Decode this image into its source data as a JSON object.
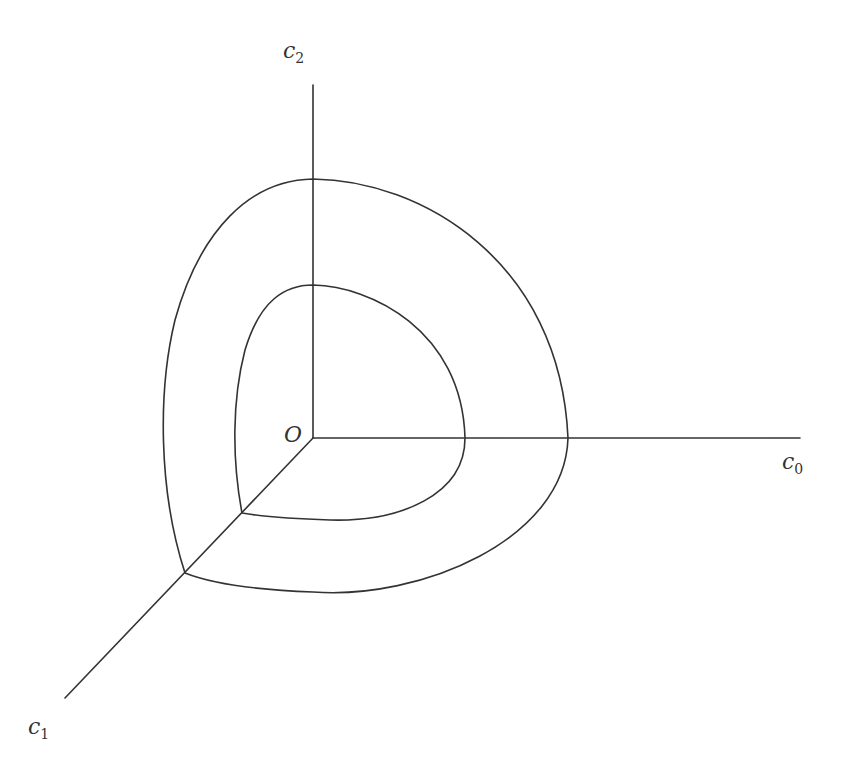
{
  "diagram": {
    "title": "",
    "stroke_color": "#333333",
    "background": "#ffffff",
    "origin": {
      "label": "O",
      "x": 313,
      "y": 438
    },
    "axes": [
      {
        "name": "c0",
        "symbol": "c",
        "subscript": "0",
        "from": [
          313,
          438
        ],
        "to": [
          800,
          438
        ],
        "label_pos": [
          782,
          451
        ]
      },
      {
        "name": "c1",
        "symbol": "c",
        "subscript": "1",
        "from": [
          313,
          438
        ],
        "to": [
          65,
          698
        ],
        "label_pos": [
          28,
          718
        ]
      },
      {
        "name": "c2",
        "symbol": "c",
        "subscript": "2",
        "from": [
          313,
          438
        ],
        "to": [
          313,
          85
        ],
        "label_pos": [
          283,
          42
        ]
      }
    ],
    "curves": [
      {
        "name": "outer-level-surface",
        "intersections": {
          "c2": [
            313,
            179
          ],
          "c0": [
            568,
            438
          ],
          "c1": [
            185,
            573
          ]
        }
      },
      {
        "name": "inner-level-surface",
        "intersections": {
          "c2": [
            313,
            285
          ],
          "c0": [
            465,
            438
          ],
          "c1": [
            242,
            513
          ]
        }
      }
    ]
  },
  "labels": {
    "origin": "O",
    "c0_symbol": "c",
    "c0_sub": "0",
    "c1_symbol": "c",
    "c1_sub": "1",
    "c2_symbol": "c",
    "c2_sub": "2"
  }
}
